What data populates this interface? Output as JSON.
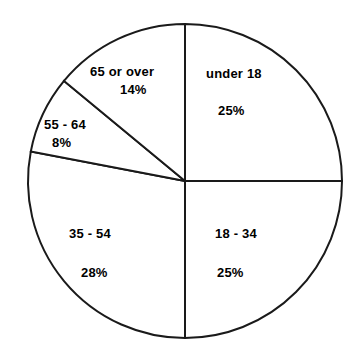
{
  "chart_data": {
    "type": "pie",
    "title": "",
    "subtitle": "",
    "xlabel": "",
    "ylabel": "",
    "legend": "none",
    "grid": false,
    "start_angle_deg": 90,
    "direction": "clockwise",
    "categories": [
      "under 18",
      "18 - 34",
      "35 - 54",
      "55 - 64",
      "65 or over"
    ],
    "values": [
      25,
      25,
      28,
      8,
      14
    ],
    "value_unit": "%",
    "slices": [
      {
        "label": "under 18",
        "value": 25,
        "value_text": "25%",
        "color": "#ffffff",
        "stroke": "#1a1a1a"
      },
      {
        "label": "18 - 34",
        "value": 25,
        "value_text": "25%",
        "color": "#ffffff",
        "stroke": "#1a1a1a"
      },
      {
        "label": "35 - 54",
        "value": 28,
        "value_text": "28%",
        "color": "#ffffff",
        "stroke": "#1a1a1a"
      },
      {
        "label": "55 - 64",
        "value": 8,
        "value_text": "8%",
        "color": "#ffffff",
        "stroke": "#1a1a1a"
      },
      {
        "label": "65 or over",
        "value": 14,
        "value_text": "14%",
        "color": "#ffffff",
        "stroke": "#1a1a1a"
      }
    ],
    "total": 100,
    "geometry": {
      "center_x": 185,
      "center_y": 181,
      "radius": 157
    },
    "colors": {
      "background": "#ffffff",
      "outline": "#1a1a1a",
      "text": "#000000"
    }
  }
}
